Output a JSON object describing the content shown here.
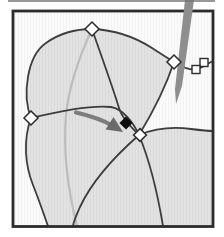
{
  "canvas": {
    "width": 224,
    "height": 237,
    "background": "#ffffff"
  },
  "palette": {
    "frame": "#2b2b2b",
    "curve": "#3d3d3d",
    "faint_curve": "#bdbdbd",
    "surface": "#e2e2e2",
    "white_region": "#fbfbfb",
    "pen": "#8e8e8e",
    "arrow": "#7d7d7d",
    "arrow_head": "#6a6a6a",
    "marker_fill": "#ffffff",
    "marker_stroke": "#2b2b2b",
    "selected_fill": "#0d0d0d",
    "artifact": "#757575"
  },
  "elements": [
    {
      "tag": "rect",
      "name": "figure-inner-background",
      "interactable": false,
      "attrs": {
        "x": 14,
        "y": 12,
        "width": 198,
        "height": 213,
        "fill": "$surface"
      }
    },
    {
      "tag": "path",
      "name": "background-region",
      "interactable": false,
      "attrs": {
        "d": "M 14,226 L 48,226 C 44,215 39,200 33,185 C 25,165 23,140 31,118 C 22,95 27,56 46,43 C 60,33 76,29 92,29 C 118,30 138,39 152,48 C 161,54 168,58 174,62 C 166,86 153,112 139,135 C 156,128 176,127 191,129 C 199,130 207,131 213,131 L 213,12 L 14,12 Z",
        "fill": "$white_region"
      }
    },
    {
      "tag": "rect",
      "name": "scanline-texture",
      "interactable": false,
      "attrs": {
        "x": 14,
        "y": 12,
        "width": 198,
        "height": 213,
        "fill": "url(#scan)"
      }
    },
    {
      "tag": "path",
      "name": "curve-faded-parameter-line",
      "interactable": false,
      "attrs": {
        "d": "M 92,29 C 80,55 69,85 66,115 C 63,150 68,190 77,226",
        "fill": "none",
        "stroke": "$faint_curve",
        "stroke-width": 2.2
      }
    },
    {
      "tag": "path",
      "name": "curve-upper-left-boundary",
      "interactable": false,
      "attrs": {
        "d": "M 31,118 C 22,95 27,56 46,43 C 60,33 76,29 92,29",
        "fill": "none",
        "stroke": "$curve",
        "stroke-width": 1.8
      }
    },
    {
      "tag": "path",
      "name": "curve-top-boundary",
      "interactable": false,
      "attrs": {
        "d": "M 92,29 C 118,30 138,39 152,48 C 161,54 168,58 174,62",
        "fill": "none",
        "stroke": "$curve",
        "stroke-width": 1.8
      }
    },
    {
      "tag": "path",
      "name": "curve-right-boundary",
      "interactable": false,
      "attrs": {
        "d": "M 174,62 C 166,86 153,112 139,135",
        "fill": "none",
        "stroke": "$curve",
        "stroke-width": 1.8
      }
    },
    {
      "tag": "path",
      "name": "curve-to-right-edge-upper",
      "interactable": false,
      "attrs": {
        "d": "M 174,62 C 182,67 189,70.5 196,69.5 C 202,68 207,64 213,61",
        "fill": "none",
        "stroke": "$curve",
        "stroke-width": 1.6
      }
    },
    {
      "tag": "path",
      "name": "curve-top-to-junction",
      "interactable": false,
      "attrs": {
        "d": "M 92,29 C 101,55 113,88 119,108 C 122,118 131,127 139,135",
        "fill": "none",
        "stroke": "$curve",
        "stroke-width": 1.8
      }
    },
    {
      "tag": "path",
      "name": "curve-left-to-junction",
      "interactable": false,
      "attrs": {
        "d": "M 31,118 C 60,111 93,105 111,107 C 123,109 133,122 139,135",
        "fill": "none",
        "stroke": "$curve",
        "stroke-width": 1.8
      }
    },
    {
      "tag": "path",
      "name": "curve-junction-to-bottom-left",
      "interactable": false,
      "attrs": {
        "d": "M 139,135 C 114,157 92,181 80,207 C 77,214 74,220 73,226",
        "fill": "none",
        "stroke": "$curve",
        "stroke-width": 1.8
      }
    },
    {
      "tag": "path",
      "name": "curve-junction-to-bottom-right",
      "interactable": false,
      "attrs": {
        "d": "M 139,135 C 149,159 157,190 163,226",
        "fill": "none",
        "stroke": "$curve",
        "stroke-width": 1.8
      }
    },
    {
      "tag": "path",
      "name": "curve-junction-to-right-edge",
      "interactable": false,
      "attrs": {
        "d": "M 139,135 C 156,128 176,127 191,129 C 199,130 207,131 213,131",
        "fill": "none",
        "stroke": "$curve",
        "stroke-width": 1.8
      }
    },
    {
      "tag": "path",
      "name": "curve-lower-left-boundary",
      "interactable": false,
      "attrs": {
        "d": "M 31,118 C 23,140 25,165 33,185 C 39,200 44,215 48,226",
        "fill": "none",
        "stroke": "$curve",
        "stroke-width": 1.8
      }
    },
    {
      "tag": "rect",
      "name": "control-point-square-outer",
      "interactable": true,
      "attrs": {
        "x": 200,
        "y": 58.5,
        "width": 8,
        "height": 8,
        "fill": "$marker_fill",
        "stroke": "$marker_stroke",
        "stroke-width": 1.4
      }
    },
    {
      "tag": "rect",
      "name": "control-point-square-inner",
      "interactable": true,
      "attrs": {
        "x": 192,
        "y": 65.5,
        "width": 8,
        "height": 8,
        "fill": "$marker_fill",
        "stroke": "$marker_stroke",
        "stroke-width": 1.4
      }
    },
    {
      "tag": "rect",
      "name": "figure-frame",
      "interactable": false,
      "attrs": {
        "x": 13,
        "y": 11,
        "width": 200,
        "height": 215.5,
        "fill": "none",
        "stroke": "$frame",
        "stroke-width": 2.8
      }
    },
    {
      "tag": "polygon",
      "name": "pen-stroke",
      "interactable": false,
      "attrs": {
        "points": "185,0 194,0 182,86 176,104 175,89",
        "fill": "$pen"
      }
    },
    {
      "tag": "path",
      "name": "arrow-shaft",
      "interactable": false,
      "attrs": {
        "d": "M 76,112.5 C 89,115.5 102,119.5 112,125.5",
        "fill": "none",
        "stroke": "$arrow",
        "stroke-width": 4.2,
        "stroke-linecap": "round"
      }
    },
    {
      "tag": "polygon",
      "name": "arrow-head",
      "interactable": false,
      "attrs": {
        "points": "123,132 105.5,129.5 113.5,117",
        "fill": "$arrow_head"
      }
    },
    {
      "tag": "polygon",
      "name": "control-point-selected",
      "interactable": true,
      "attrs": {
        "points": "126,116.4 132.6,123 126,129.6 119.4,123",
        "fill": "$selected_fill"
      }
    },
    {
      "tag": "polygon",
      "name": "control-point-junction",
      "interactable": true,
      "attrs": {
        "points": "140,128.6 146.4,135 140,141.4 133.6,135",
        "fill": "$marker_fill",
        "stroke": "$marker_stroke",
        "stroke-width": 1.5
      }
    },
    {
      "tag": "polygon",
      "name": "control-point-top",
      "interactable": true,
      "attrs": {
        "points": "92,22 99,29 92,36 85,29",
        "fill": "$marker_fill",
        "stroke": "$marker_stroke",
        "stroke-width": 1.5
      }
    },
    {
      "tag": "polygon",
      "name": "control-point-right",
      "interactable": true,
      "attrs": {
        "points": "174,55 181,62 174,69 167,62",
        "fill": "$marker_fill",
        "stroke": "$marker_stroke",
        "stroke-width": 1.5
      }
    },
    {
      "tag": "polygon",
      "name": "control-point-left",
      "interactable": true,
      "attrs": {
        "points": "31,111 38,118 31,125 24,118",
        "fill": "$marker_fill",
        "stroke": "$marker_stroke",
        "stroke-width": 1.5
      }
    },
    {
      "tag": "line",
      "name": "crop-artifact-line",
      "interactable": false,
      "attrs": {
        "x1": 8,
        "y1": 1,
        "x2": 215,
        "y2": 1,
        "stroke": "$artifact",
        "stroke-width": 1.3
      }
    }
  ]
}
